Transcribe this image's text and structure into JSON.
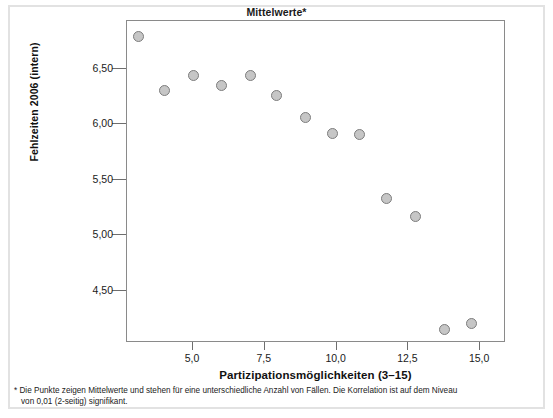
{
  "chart_data": {
    "type": "scatter",
    "title": "Mittelwerte*",
    "xlabel": "Partizipationsmöglichkeiten (3–15)",
    "ylabel": "Fehlzeiten 2006 (intern)",
    "xlim": [
      2.7,
      15.9
    ],
    "ylim": [
      4.03,
      6.93
    ],
    "xticks": [
      5.0,
      7.5,
      10.0,
      12.5,
      15.0
    ],
    "xtick_labels": [
      "5,0",
      "7,5",
      "10,0",
      "12,5",
      "15,0"
    ],
    "yticks": [
      6.5,
      6.0,
      5.5,
      5.0,
      4.5
    ],
    "ytick_labels": [
      "6,50",
      "6,00",
      "5,50",
      "5,00",
      "4,50"
    ],
    "grid": false,
    "legend": "none",
    "marker": {
      "shape": "circle",
      "fill": "#c6c6c6",
      "edge": "#7d7d7d",
      "size_px": 11
    },
    "points": [
      {
        "x": 3.1,
        "y": 6.79
      },
      {
        "x": 4.0,
        "y": 6.3
      },
      {
        "x": 5.0,
        "y": 6.44
      },
      {
        "x": 6.0,
        "y": 6.35
      },
      {
        "x": 7.0,
        "y": 6.44
      },
      {
        "x": 7.9,
        "y": 6.26
      },
      {
        "x": 8.9,
        "y": 6.06
      },
      {
        "x": 9.85,
        "y": 5.92
      },
      {
        "x": 10.8,
        "y": 5.91
      },
      {
        "x": 11.75,
        "y": 5.33
      },
      {
        "x": 12.75,
        "y": 5.17
      },
      {
        "x": 13.75,
        "y": 4.15
      },
      {
        "x": 14.7,
        "y": 4.21
      }
    ]
  },
  "footnote": {
    "line1": "* Die Punkte zeigen Mittelwerte und stehen für eine unterschiedliche Anzahl von Fällen. Die Korrelation ist auf dem Niveau",
    "line2": "von 0,01 (2-seitig) signifikant."
  },
  "colors": {
    "frame": "#e2e2e2",
    "axis": "#8a8a8a",
    "text": "#1a1a1a",
    "marker_fill": "#c6c6c6",
    "marker_edge": "#7d7d7d"
  }
}
